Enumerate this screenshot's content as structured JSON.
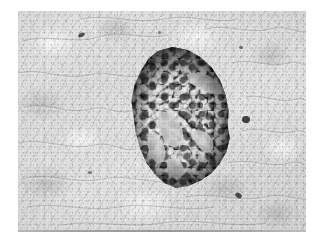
{
  "image": {
    "kind": "histology-micrograph",
    "modality": "brightfield-light-microscopy",
    "staining": "dark-chromogen-on-pale-counterstain",
    "color_mode": "grayscale",
    "alt_text": "Grayscale histological micrograph of pancreatic tissue showing a darkly stained, roughly circular islet of Langerhans surrounded by pale exocrine acinar parenchyma.",
    "canvas": {
      "width": 322,
      "height": 246,
      "background": "#ffffff"
    },
    "plate": {
      "left": 18,
      "top": 11,
      "width": 288,
      "height": 221,
      "mean_tone": "#dcdcdc",
      "has_bottom_edge_line": true
    }
  },
  "palette": {
    "page_background": "#ffffff",
    "tissue_light": "#e6e6e6",
    "tissue_mid": "#c2c2c2",
    "tissue_shadow": "#8f8f8f",
    "islet_dark": "#202020",
    "islet_mid": "#3a3a3a",
    "islet_granule_bright": "#e8e8e8",
    "nucleus_speck": "#4a4a4a"
  },
  "regions": {
    "islet": {
      "label": "islet-of-langerhans",
      "center_x": 161,
      "center_y": 108,
      "width": 108,
      "height": 145,
      "shape": "irregular-round",
      "tone": "dark",
      "description": "Compact endocrine cell cluster with bright granular cells separated by dark stroma and pale capillary channels."
    },
    "acinar": {
      "label": "exocrine-acinar-tissue",
      "tone": "pale-mottled",
      "description": "Surrounding pancreatic acini with pale cytoplasm and faint cell boundaries."
    }
  },
  "features": {
    "capillaries": [
      {
        "name": "capillary-upper",
        "path": "M 62 28 C 70 24, 82 27, 90 33 C 96 38, 97 44, 92 46 C 84 48, 74 42, 66 36 Z"
      },
      {
        "name": "capillary-central",
        "path": "M 34 66 C 44 62, 52 70, 56 80 C 60 90, 56 100, 48 100 C 40 98, 36 86, 32 76 Z"
      },
      {
        "name": "capillary-lower-left",
        "path": "M 24 88 C 32 86, 38 94, 40 104 C 41 112, 36 118, 30 114 C 24 108, 22 96, 24 88 Z"
      },
      {
        "name": "capillary-right",
        "path": "M 68 84 C 78 82, 86 88, 88 96 C 89 104, 82 108, 76 102 C 70 96, 66 88, 68 84 Z"
      },
      {
        "name": "capillary-bottom",
        "path": "M 46 112 C 54 110, 60 118, 58 126 C 56 132, 48 132, 44 126 C 41 120, 42 114, 46 112 Z"
      }
    ],
    "specks": [
      {
        "name": "speck-top-left",
        "x": 60,
        "y": 22,
        "w": 7,
        "h": 4,
        "rot": -28,
        "tone": "#4f4f4f"
      },
      {
        "name": "speck-top-right",
        "x": 221,
        "y": 35,
        "w": 4,
        "h": 3,
        "rot": 18,
        "tone": "#6a6a6a"
      },
      {
        "name": "speck-mid-right",
        "x": 224,
        "y": 105,
        "w": 8,
        "h": 7,
        "rot": 12,
        "tone": "#3d3d3d"
      },
      {
        "name": "speck-bottom-right",
        "x": 217,
        "y": 182,
        "w": 7,
        "h": 5,
        "rot": 34,
        "tone": "#474747"
      },
      {
        "name": "speck-lower-left",
        "x": 70,
        "y": 160,
        "w": 4,
        "h": 3,
        "rot": 0,
        "tone": "#757575"
      },
      {
        "name": "speck-upper-mid",
        "x": 140,
        "y": 20,
        "w": 3,
        "h": 3,
        "rot": 0,
        "tone": "#7d7d7d"
      }
    ],
    "acinar_boundaries": [
      "M 4 30 C 30 22, 58 34, 80 26 C 104 18, 128 30, 150 24",
      "M 0 62 C 24 56, 44 70, 70 64 C 92 58, 106 70, 124 64",
      "M 6 96 C 28 90, 48 104, 72 98 C 90 94, 98 104, 112 100",
      "M 0 132 C 26 126, 50 140, 76 134 C 96 130, 104 142, 118 138",
      "M 4 168 C 30 160, 56 174, 84 168 C 112 162, 140 176, 168 170",
      "M 10 196 C 40 190, 70 202, 100 196 C 132 190, 164 202, 196 196",
      "M 188 18 C 208 12, 232 24, 252 18 C 270 13, 280 24, 288 20",
      "M 214 52 C 234 46, 252 58, 270 52 C 280 48, 286 56, 288 54",
      "M 228 86 C 246 82, 262 94, 278 88 C 284 86, 288 90, 288 90",
      "M 224 120 C 244 114, 260 126, 278 120 C 284 118, 288 122, 288 122",
      "M 210 152 C 232 146, 252 158, 272 152 C 282 149, 288 155, 288 154",
      "M 168 186 C 194 180, 220 192, 246 186 C 268 181, 280 190, 288 188",
      "M 62 8 C 90 2, 118 14, 146 8 C 172 2, 196 14, 220 8",
      "M 44 214 C 76 208, 110 218, 144 212 C 180 206, 214 218, 248 212"
    ]
  }
}
